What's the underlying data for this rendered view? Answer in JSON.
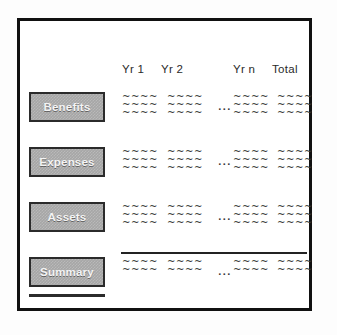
{
  "diagram": {
    "frame": {
      "border_color": "#111111"
    },
    "columns": [
      {
        "label": "Yr 1"
      },
      {
        "label": "Yr 2"
      },
      {
        "label": "Yr n"
      },
      {
        "label": "Total"
      }
    ],
    "ellipsis": "...",
    "placeholder_mark": "~~~~",
    "sections": [
      {
        "label": "Benefits",
        "data_rows": 3,
        "has_underline": false
      },
      {
        "label": "Expenses",
        "data_rows": 3,
        "has_underline": false
      },
      {
        "label": "Assets",
        "data_rows": 3,
        "has_underline": false
      },
      {
        "label": "Summary",
        "data_rows": 2,
        "has_underline": true
      }
    ],
    "colors": {
      "box_fill": "#a6a6a6",
      "box_border": "#2b2b2b",
      "box_text": "#f4f4f4",
      "rule": "#232323",
      "header_text": "#2a2a2a",
      "data_text": "#3a3a3a",
      "background": "#ffffff"
    }
  }
}
